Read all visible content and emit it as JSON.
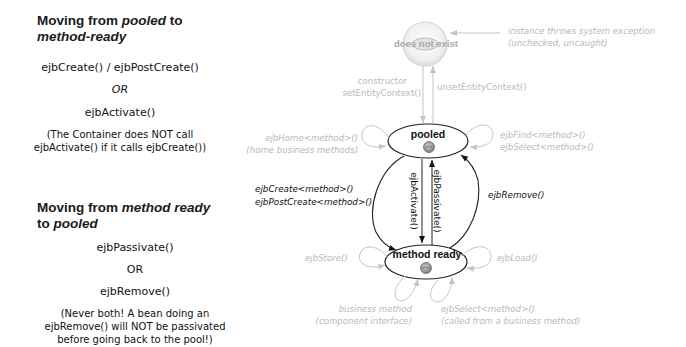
{
  "left_panel": {
    "section1": {
      "heading_prefix": "Moving from ",
      "heading_em1": "pooled",
      "heading_mid": " to",
      "heading_em2": "method-ready",
      "line1": "ejbCreate() / ejbPostCreate()",
      "or": "OR",
      "line2": "ejbActivate()",
      "note_line1": "(The Container does NOT call",
      "note_line2": "ejbActivate() if it calls ejbCreate())"
    },
    "section2": {
      "heading_prefix": "Moving from ",
      "heading_em1": "method ready",
      "heading_mid": "to ",
      "heading_em2": "pooled",
      "line1": "ejbPassivate()",
      "or": "OR",
      "line2": "ejbRemove()",
      "note_line1": "(Never both! A bean doing an",
      "note_line2": "ejbRemove() will NOT be passivated",
      "note_line3": "before going back to the pool!)"
    }
  },
  "diagram": {
    "states": {
      "does_not_exist": "does not exist",
      "pooled": "pooled",
      "method_ready": "method ready"
    },
    "transitions": {
      "system_exception_1": "instance throws system exception",
      "system_exception_2": "(unchecked, uncaught)",
      "constructor_1": "constructor",
      "constructor_2": "setEntityContext()",
      "unset": "unsetEntityContext()",
      "home_1": "ejbHome<method>()",
      "home_2": "(home business methods)",
      "find_1": "ejbFind<method>()",
      "find_2": "ejbSelect<method>()",
      "create_1": "ejbCreate<method>()",
      "create_2": "ejbPostCreate<method>()",
      "activate": "ejbActivate()",
      "passivate": "ejbPassivate()",
      "remove": "ejbRemove()",
      "store": "ejbStore()",
      "load": "ejbLoad()",
      "business_1": "business method",
      "business_2": "(component interface)",
      "select_1": "ejbSelect<method>()",
      "select_2": "(called from a business method)"
    },
    "colors": {
      "active": "#111111",
      "faded": "#bdbdbd",
      "bean_icon": "#8a8a8a"
    }
  }
}
